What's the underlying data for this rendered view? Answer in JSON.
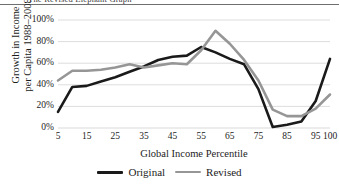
{
  "figure": {
    "title": "The Revised Elephant Graph",
    "rule_color": "#6f6f6f"
  },
  "chart_data": {
    "type": "line",
    "title": "The Revised Elephant Graph",
    "xlabel": "Global Income Percentile",
    "ylabel": "Growth in Income\nper Capita 1988–2008",
    "xlim": [
      5,
      100
    ],
    "ylim": [
      0,
      100
    ],
    "grid": true,
    "grid_axis": "y",
    "legend_position": "bottom-center",
    "x_tick_labels": [
      "5",
      "15",
      "25",
      "35",
      "45",
      "55",
      "65",
      "75",
      "85",
      "95",
      "100"
    ],
    "x_tick_values": [
      5,
      15,
      25,
      35,
      45,
      55,
      65,
      75,
      85,
      95,
      100
    ],
    "y_tick_labels": [
      "100%",
      "80%",
      "60%",
      "40%",
      "20%",
      "0%"
    ],
    "y_tick_values": [
      100,
      80,
      60,
      40,
      20,
      0
    ],
    "x": [
      5,
      10,
      15,
      20,
      25,
      30,
      35,
      40,
      45,
      50,
      55,
      60,
      65,
      70,
      75,
      80,
      85,
      90,
      95,
      100
    ],
    "series": [
      {
        "name": "Original",
        "color": "#1a1a1a",
        "width": 2.6,
        "values": [
          15,
          38,
          39,
          43,
          47,
          52,
          57,
          63,
          66,
          67,
          75,
          70,
          64,
          59,
          36,
          1,
          3,
          6,
          25,
          64
        ]
      },
      {
        "name": "Revised",
        "color": "#969696",
        "width": 2.6,
        "values": [
          44,
          53,
          53,
          54,
          56,
          59,
          56,
          58,
          60,
          59,
          72,
          90,
          78,
          63,
          44,
          17,
          11,
          11,
          18,
          31
        ]
      }
    ]
  },
  "legend": {
    "items": [
      {
        "label": "Original",
        "color": "#1a1a1a"
      },
      {
        "label": "Revised",
        "color": "#969696"
      }
    ]
  }
}
